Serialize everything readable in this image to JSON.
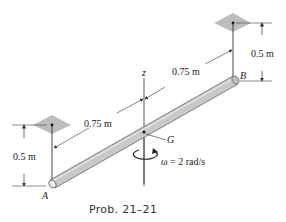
{
  "figure": {
    "caption": "Prob. 21–21",
    "labels": {
      "end_a": "A",
      "end_b": "B",
      "center_of_mass": "G",
      "axis": "z",
      "omega": "ω = 2 rad/s"
    },
    "dimensions": {
      "left_half_length": "0.75 m",
      "right_half_length": "0.75 m",
      "left_drop_height": "0.5 m",
      "right_drop_height": "0.5 m"
    },
    "colors": {
      "rod_fill": "#c8c8c8",
      "rod_edge": "#555555",
      "support_plate": "#bdbdbd",
      "line": "#333333"
    }
  }
}
